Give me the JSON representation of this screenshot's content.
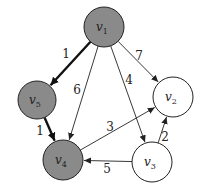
{
  "diagram": {
    "type": "directed-weighted-graph",
    "colors": {
      "visited_fill": "#8a8a8a",
      "unvisited_fill": "#ffffff",
      "stroke": "#222222",
      "background": "#ffffff"
    },
    "nodes": [
      {
        "id": "v1",
        "label": "v",
        "sub": "1",
        "x": 104,
        "y": 27,
        "r": 20,
        "visited": true
      },
      {
        "id": "v2",
        "label": "v",
        "sub": "2",
        "x": 173,
        "y": 97,
        "r": 20,
        "visited": false
      },
      {
        "id": "v3",
        "label": "v",
        "sub": "3",
        "x": 152,
        "y": 162,
        "r": 20,
        "visited": false
      },
      {
        "id": "v4",
        "label": "v",
        "sub": "4",
        "x": 63,
        "y": 160,
        "r": 20,
        "visited": true
      },
      {
        "id": "v5",
        "label": "v",
        "sub": "5",
        "x": 37,
        "y": 100,
        "r": 19,
        "visited": true
      }
    ],
    "edges": [
      {
        "from": "v1",
        "to": "v5",
        "weight": "1",
        "bold": true,
        "lx": 66,
        "ly": 58
      },
      {
        "from": "v1",
        "to": "v4",
        "weight": "6",
        "bold": false,
        "lx": 77,
        "ly": 94
      },
      {
        "from": "v1",
        "to": "v3",
        "weight": "4",
        "bold": false,
        "lx": 129,
        "ly": 84
      },
      {
        "from": "v1",
        "to": "v2",
        "weight": "7",
        "bold": false,
        "lx": 139,
        "ly": 60
      },
      {
        "from": "v5",
        "to": "v4",
        "weight": "1",
        "bold": true,
        "lx": 40,
        "ly": 135
      },
      {
        "from": "v4",
        "to": "v2",
        "weight": "3",
        "bold": false,
        "lx": 110,
        "ly": 131
      },
      {
        "from": "v3",
        "to": "v2",
        "weight": "2",
        "bold": false,
        "lx": 165,
        "ly": 141
      },
      {
        "from": "v3",
        "to": "v4",
        "weight": "5",
        "bold": false,
        "lx": 107,
        "ly": 173
      }
    ]
  }
}
